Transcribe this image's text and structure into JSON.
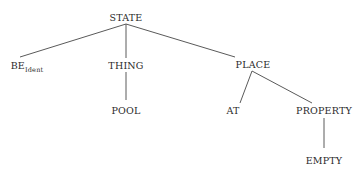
{
  "tree": {
    "root": {
      "label": "STATE"
    },
    "nodes": {
      "state": {
        "label": "STATE"
      },
      "be": {
        "label": "BE",
        "subscript": "Ident"
      },
      "thing": {
        "label": "THING"
      },
      "place": {
        "label": "PLACE"
      },
      "pool": {
        "label": "POOL"
      },
      "at": {
        "label": "AT"
      },
      "property": {
        "label": "PROPERTY"
      },
      "empty": {
        "label": "EMPTY"
      }
    },
    "edges": [
      [
        "STATE",
        "BE_Ident"
      ],
      [
        "STATE",
        "THING"
      ],
      [
        "STATE",
        "PLACE"
      ],
      [
        "THING",
        "POOL"
      ],
      [
        "PLACE",
        "AT"
      ],
      [
        "PLACE",
        "PROPERTY"
      ],
      [
        "PROPERTY",
        "EMPTY"
      ]
    ],
    "line_color": "#555555",
    "text_color": "#2a2a2a"
  }
}
